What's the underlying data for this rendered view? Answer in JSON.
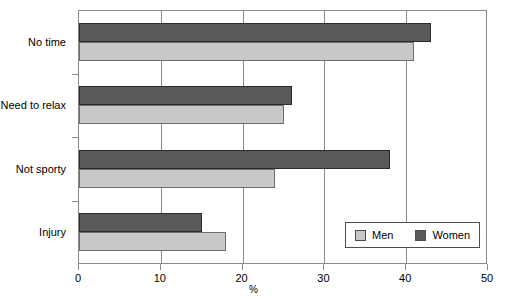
{
  "chart_data": {
    "type": "bar",
    "orientation": "horizontal",
    "title": "",
    "xlabel": "%",
    "ylabel": "",
    "xlim": [
      0,
      50
    ],
    "xticks": [
      0,
      10,
      20,
      30,
      40,
      50
    ],
    "xtick_labels": [
      "0",
      "10",
      "20",
      "30",
      "40",
      "50"
    ],
    "grid": "vertical",
    "legend_position": "bottom-right-inside",
    "categories": [
      "No time",
      "Need to relax",
      "Not sporty",
      "Injury"
    ],
    "series": [
      {
        "name": "Men",
        "color": "#c8c8c8",
        "values": [
          41,
          25,
          24,
          18
        ]
      },
      {
        "name": "Women",
        "color": "#595959",
        "values": [
          43,
          26,
          38,
          15
        ]
      }
    ]
  },
  "legend": {
    "entries": [
      {
        "label": "Men"
      },
      {
        "label": "Women"
      }
    ]
  },
  "colors": {
    "men": "#c8c8c8",
    "women": "#595959",
    "axis": "#8a8a8a",
    "text": "#000000",
    "background": "#ffffff"
  }
}
